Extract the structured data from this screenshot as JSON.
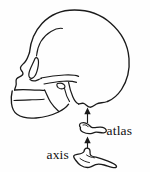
{
  "figure": {
    "name": "skull-lateral-with-cervical-vertebrae",
    "background_color": "#fefefe",
    "line_color": "#1a1a1a"
  },
  "labels": {
    "atlas": "atlas",
    "axis": "axis"
  },
  "parts": {
    "skull": "skull",
    "cranial_vault": "cranial-vault",
    "frontal_bone": "frontal-bone",
    "orbit": "orbit",
    "nasal_aperture": "nasal-aperture",
    "maxilla": "maxilla",
    "mandible": "mandible",
    "zygomatic_arch": "zygomatic-arch",
    "temporal_line": "temporal-line",
    "mastoid_process": "mastoid-process",
    "occipital": "occipital-region",
    "atlas_vertebra": "atlas-vertebra-c1",
    "axis_vertebra": "axis-vertebra-c2"
  },
  "connectors": {
    "upper_arrow": "arrow-atlas-to-skull",
    "lower_arrow": "arrow-axis-to-atlas"
  }
}
